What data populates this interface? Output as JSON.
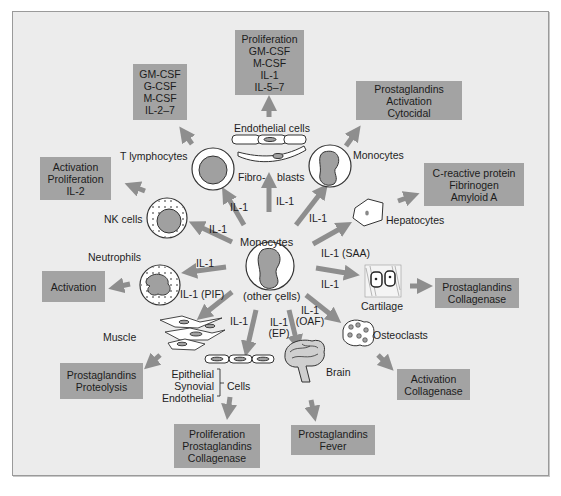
{
  "diagram": {
    "center": {
      "label_top": "Monocytes",
      "label_bottom": "(other çells)"
    },
    "colors": {
      "background": "#ececec",
      "box_fill": "#a3a3a3",
      "arrow": "#8e8e8e",
      "cell_nucleus": "#a0a0a0",
      "border": "#9a9a9a"
    },
    "targets": [
      {
        "id": "t-lymphocytes",
        "label": "T lymphocytes",
        "signal": "IL-1",
        "effects": [
          "GM-CSF",
          "G-CSF",
          "M-CSF",
          "IL-2–7"
        ]
      },
      {
        "id": "endothelial-fibroblasts",
        "label_top": "Endothelial cells",
        "label_left": "Fibro-",
        "label_right": "blasts",
        "signal": "IL-1",
        "effects": [
          "Proliferation",
          "GM-CSF",
          "M-CSF",
          "IL-1",
          "IL-5–7"
        ]
      },
      {
        "id": "monocytes",
        "label": "Monocytes",
        "signal": "IL-1",
        "effects": [
          "Prostaglandins",
          "Activation",
          "Cytocidal"
        ]
      },
      {
        "id": "nk-cells",
        "label": "NK cells",
        "signal": "IL-1",
        "effects": [
          "Activation",
          "Proliferation",
          "IL-2"
        ]
      },
      {
        "id": "hepatocytes",
        "label": "Hepatocytes",
        "signal": "IL-1 (SAA)",
        "effects": [
          "C-reactive protein",
          "Fibrinogen",
          "Amyloid A"
        ]
      },
      {
        "id": "neutrophils",
        "label": "Neutrophils",
        "signal": "IL-1",
        "effects": [
          "Activation"
        ]
      },
      {
        "id": "cartilage",
        "label": "Cartilage",
        "signal": "IL-1",
        "effects": [
          "Prostaglandins",
          "Collagenase"
        ]
      },
      {
        "id": "muscle",
        "label": "Muscle",
        "signal": "IL-1 (PIF)",
        "effects": [
          "Prostaglandins",
          "Proteolysis"
        ]
      },
      {
        "id": "osteoclasts",
        "label": "Osteoclasts",
        "signal_line1": "IL-1",
        "signal_line2": "(OAF)",
        "effects": [
          "Activation",
          "Collagenase"
        ]
      },
      {
        "id": "epithelial-cells",
        "types": [
          "Epithelial",
          "Synovial",
          "Endothelial"
        ],
        "group_label": "Cells",
        "signal": "IL-1",
        "effects": [
          "Proliferation",
          "Prostaglandins",
          "Collagenase"
        ]
      },
      {
        "id": "brain",
        "label": "Brain",
        "signal_line1": "IL-1",
        "signal_line2": "(EP)",
        "effects": [
          "Prostaglandins",
          "Fever"
        ]
      }
    ]
  }
}
